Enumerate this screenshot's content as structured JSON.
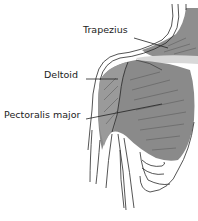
{
  "diagram": {
    "labels": [
      {
        "id": "trapezius",
        "text": "Trapezius"
      },
      {
        "id": "deltoid",
        "text": "Deltoid"
      },
      {
        "id": "pectoralis-major",
        "text": "Pectoralis major"
      }
    ],
    "colors": {
      "muscle_fill": "#8a8a8a",
      "muscle_light": "#b8b8b8",
      "highlight": "#d9d9d9",
      "outline": "#2a2a2a",
      "label_text": "#222222",
      "background": "#ffffff"
    }
  }
}
